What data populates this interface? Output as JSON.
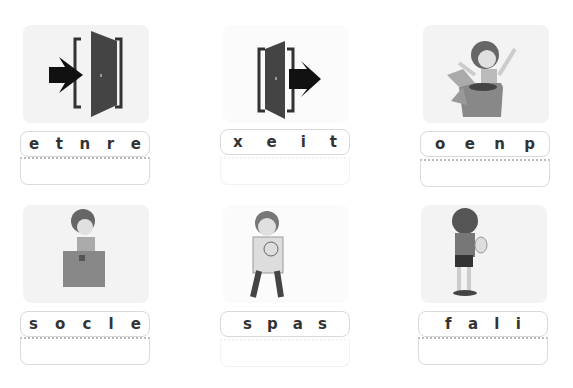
{
  "worksheet": {
    "cards": [
      {
        "picture": "enter-door-icon",
        "letters": [
          "e",
          "t",
          "n",
          "r",
          "e"
        ]
      },
      {
        "picture": "exit-door-icon",
        "letters": [
          "x",
          "e",
          "i",
          "t"
        ]
      },
      {
        "picture": "boy-opening-box",
        "letters": [
          "o",
          "e",
          "n",
          "p"
        ]
      },
      {
        "picture": "boy-closing-box",
        "letters": [
          "s",
          "o",
          "c",
          "l",
          "e"
        ]
      },
      {
        "picture": "boy-with-pass-test",
        "letters": [
          "s",
          "p",
          "a",
          "s"
        ]
      },
      {
        "picture": "boy-crying-fail-test",
        "letters": [
          "f",
          "a",
          "l",
          "i"
        ]
      }
    ]
  }
}
